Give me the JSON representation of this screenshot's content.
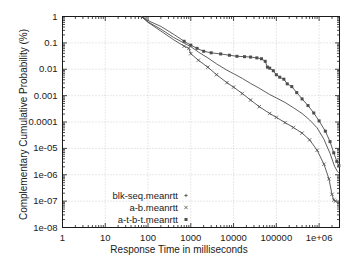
{
  "chart_data": {
    "type": "line",
    "title": "",
    "xlabel": "Response Time in milliseconds",
    "ylabel": "Complementary Cumulative Probability (%)",
    "xscale": "log",
    "yscale": "log",
    "xlim": [
      1,
      3000000
    ],
    "ylim": [
      1e-08,
      1
    ],
    "grid": true,
    "legend_position": "bottom-left",
    "xticks": [
      "1",
      "10",
      "100",
      "1000",
      "10000",
      "100000",
      "1e+06"
    ],
    "xtick_values": [
      1,
      10,
      100,
      1000,
      10000,
      100000,
      1000000
    ],
    "yticks": [
      "1",
      "0.1",
      "0.01",
      "0.001",
      "0.0001",
      "1e-05",
      "1e-06",
      "1e-07",
      "1e-08"
    ],
    "ytick_values": [
      1,
      0.1,
      0.01,
      0.001,
      0.0001,
      1e-05,
      1e-06,
      1e-07,
      1e-08
    ],
    "series": [
      {
        "name": "blk-seq.meanrtt",
        "marker": "plus",
        "color": "#4d4d4d",
        "points": [
          [
            70,
            1.0
          ],
          [
            100,
            0.62
          ],
          [
            200,
            0.33
          ],
          [
            400,
            0.16
          ],
          [
            700,
            0.098
          ],
          [
            1000,
            0.072
          ],
          [
            1500,
            0.045
          ],
          [
            2500,
            0.027
          ],
          [
            4000,
            0.016
          ],
          [
            7000,
            0.0092
          ],
          [
            10000,
            0.0068
          ],
          [
            16000,
            0.0045
          ],
          [
            25000,
            0.0029
          ],
          [
            40000,
            0.0019
          ],
          [
            70000,
            0.0011
          ],
          [
            100000,
            0.00082
          ],
          [
            160000,
            0.00055
          ],
          [
            250000,
            0.00035
          ],
          [
            400000,
            0.00021
          ],
          [
            600000,
            0.00012
          ],
          [
            900000,
            6e-05
          ],
          [
            1300000,
            2.2e-05
          ],
          [
            1800000,
            6.5e-06
          ],
          [
            2300000,
            2.1e-06
          ],
          [
            2700000,
            1.3e-06
          ],
          [
            2900000,
            1.2e-06
          ]
        ]
      },
      {
        "name": "a-b.meanrtt",
        "marker": "cross",
        "color": "#4d4d4d",
        "points": [
          [
            70,
            1.0
          ],
          [
            100,
            0.6
          ],
          [
            200,
            0.28
          ],
          [
            400,
            0.13
          ],
          [
            700,
            0.075
          ],
          [
            900,
            0.062
          ],
          [
            1000,
            0.039
          ],
          [
            1500,
            0.022
          ],
          [
            2500,
            0.012
          ],
          [
            4000,
            0.0062
          ],
          [
            7000,
            0.0031
          ],
          [
            10000,
            0.0021
          ],
          [
            16000,
            0.0012
          ],
          [
            25000,
            0.00068
          ],
          [
            40000,
            0.00038
          ],
          [
            70000,
            0.00021
          ],
          [
            100000,
            0.00015
          ],
          [
            160000,
            9.5e-05
          ],
          [
            250000,
            6.2e-05
          ],
          [
            400000,
            3.8e-05
          ],
          [
            600000,
            2.1e-05
          ],
          [
            900000,
            8.5e-06
          ],
          [
            1300000,
            2.5e-06
          ],
          [
            1700000,
            7e-07
          ],
          [
            2000000,
            1.8e-07
          ],
          [
            2200000,
            1.1e-07
          ],
          [
            2400000,
            1e-07
          ]
        ]
      },
      {
        "name": "a-t-b-t.meanrtt",
        "marker": "square",
        "color": "#4d4d4d",
        "points": [
          [
            70,
            1.0
          ],
          [
            100,
            0.7
          ],
          [
            200,
            0.42
          ],
          [
            400,
            0.21
          ],
          [
            700,
            0.115
          ],
          [
            1000,
            0.082
          ],
          [
            1400,
            0.062
          ],
          [
            2000,
            0.048
          ],
          [
            3000,
            0.042
          ],
          [
            5000,
            0.038
          ],
          [
            8000,
            0.034
          ],
          [
            12000,
            0.031
          ],
          [
            18000,
            0.03
          ],
          [
            25000,
            0.029
          ],
          [
            35000,
            0.027
          ],
          [
            45000,
            0.025
          ],
          [
            55000,
            0.02
          ],
          [
            62000,
            0.012
          ],
          [
            70000,
            0.011
          ],
          [
            85000,
            0.0088
          ],
          [
            100000,
            0.0062
          ],
          [
            120000,
            0.005
          ],
          [
            150000,
            0.0042
          ],
          [
            180000,
            0.0028
          ],
          [
            230000,
            0.0022
          ],
          [
            300000,
            0.0013
          ],
          [
            400000,
            0.00075
          ],
          [
            550000,
            0.00042
          ],
          [
            750000,
            0.00022
          ],
          [
            1000000,
            0.00011
          ],
          [
            1400000,
            4.5e-05
          ],
          [
            1800000,
            1.8e-05
          ],
          [
            2200000,
            6.8e-06
          ],
          [
            2600000,
            3.2e-06
          ],
          [
            2900000,
            2.2e-06
          ]
        ]
      }
    ]
  },
  "legend": {
    "entries": [
      {
        "label": "blk-seq.meanrtt",
        "marker": "plus"
      },
      {
        "label": "a-b.meanrtt",
        "marker": "cross"
      },
      {
        "label": "a-t-b-t.meanrtt",
        "marker": "square"
      }
    ]
  }
}
